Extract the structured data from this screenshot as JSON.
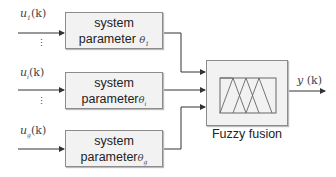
{
  "inputs": [
    {
      "name": "u",
      "sub": "1",
      "arg": "(k)"
    },
    {
      "name": "u",
      "sub": "i",
      "arg": "(k)"
    },
    {
      "name": "u",
      "sub": "g",
      "arg": "(k)"
    }
  ],
  "systems": [
    {
      "line1": "system",
      "line2": "parameter",
      "theta": "θ",
      "sub": "1"
    },
    {
      "line1": "system",
      "line2": "parameter",
      "theta": "θ",
      "sub": "i"
    },
    {
      "line1": "system",
      "line2": "parameter",
      "theta": "θ",
      "sub": "g"
    }
  ],
  "fusion": {
    "label": "Fuzzy fusion"
  },
  "output": {
    "name": "y",
    "arg": "(k)"
  },
  "ellipsis": "⋮",
  "colors": {
    "line": "#333333",
    "box_fill": "#f2f2f2",
    "box_border": "#8c8c8c"
  }
}
